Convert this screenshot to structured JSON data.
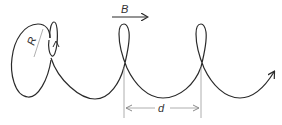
{
  "diagram": {
    "type": "helical-trajectory",
    "labels": {
      "field": "B",
      "radius": "R",
      "pitch": "d"
    },
    "colors": {
      "curve": "#2a2a2a",
      "annotation": "#9a9a9a",
      "text": "#333333",
      "background": "#ffffff"
    }
  }
}
